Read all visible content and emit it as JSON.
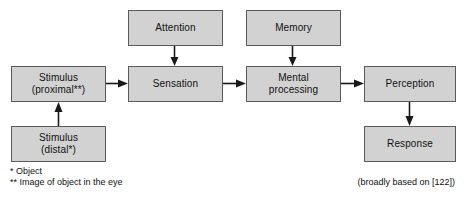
{
  "diagram": {
    "colors": {
      "box_fill": "#d2d2d2",
      "box_border": "#5a5a5a",
      "arrow": "#1a1a1a",
      "background": "#ffffff",
      "text": "#111111"
    },
    "nodes": [
      {
        "id": "attention",
        "label": "Attention",
        "x": 128,
        "y": 10,
        "w": 95,
        "h": 36
      },
      {
        "id": "memory",
        "label": "Memory",
        "x": 246,
        "y": 10,
        "w": 95,
        "h": 36
      },
      {
        "id": "stimulus-proximal",
        "label": "Stimulus\n(proximal**)",
        "x": 11,
        "y": 66,
        "w": 95,
        "h": 36
      },
      {
        "id": "sensation",
        "label": "Sensation",
        "x": 128,
        "y": 66,
        "w": 95,
        "h": 36
      },
      {
        "id": "mental-processing",
        "label": "Mental\nprocessing",
        "x": 246,
        "y": 66,
        "w": 95,
        "h": 36
      },
      {
        "id": "perception",
        "label": "Perception",
        "x": 364,
        "y": 66,
        "w": 92,
        "h": 36
      },
      {
        "id": "stimulus-distal",
        "label": "Stimulus\n(distal*)",
        "x": 11,
        "y": 126,
        "w": 95,
        "h": 36
      },
      {
        "id": "response",
        "label": "Response",
        "x": 364,
        "y": 126,
        "w": 92,
        "h": 36
      }
    ],
    "edges": [
      {
        "id": "attention-to-sensation",
        "from": "attention",
        "to": "sensation",
        "direction": "down"
      },
      {
        "id": "memory-to-mental-processing",
        "from": "memory",
        "to": "mental-processing",
        "direction": "down"
      },
      {
        "id": "stimulus-distal-to-proximal",
        "from": "stimulus-distal",
        "to": "stimulus-proximal",
        "direction": "up"
      },
      {
        "id": "stimulus-proximal-to-sensation",
        "from": "stimulus-proximal",
        "to": "sensation",
        "direction": "right"
      },
      {
        "id": "sensation-to-mental-processing",
        "from": "sensation",
        "to": "mental-processing",
        "direction": "right"
      },
      {
        "id": "mental-processing-to-perception",
        "from": "mental-processing",
        "to": "perception",
        "direction": "right"
      },
      {
        "id": "perception-to-response",
        "from": "perception",
        "to": "response",
        "direction": "down"
      }
    ],
    "footnotes": {
      "line1": "* Object",
      "line2": "** Image of object in the eye"
    },
    "caption": "(broadly based on [122])"
  }
}
